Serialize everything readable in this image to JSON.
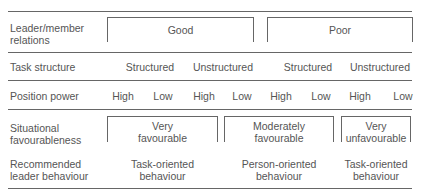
{
  "rows": {
    "relations": {
      "label_line1": "Leader/member",
      "label_line2": "relations",
      "groups": [
        "Good",
        "Poor"
      ]
    },
    "task_structure": {
      "label": "Task structure",
      "values": [
        "Structured",
        "Unstructured",
        "Structured",
        "Unstructured"
      ]
    },
    "position_power": {
      "label": "Position power",
      "values": [
        "High",
        "Low",
        "High",
        "Low",
        "High",
        "Low",
        "High",
        "Low"
      ]
    },
    "favourableness": {
      "label_line1": "Situational",
      "label_line2": "favourableness",
      "groups": [
        {
          "line1": "Very",
          "line2": "favourable"
        },
        {
          "line1": "Moderately",
          "line2": "favourable"
        },
        {
          "line1": "Very",
          "line2": "unfavourable"
        }
      ]
    },
    "behaviour": {
      "label_line1": "Recommended",
      "label_line2": "leader behaviour",
      "groups": [
        {
          "line1": "Task-oriented",
          "line2": "behaviour"
        },
        {
          "line1": "Person-oriented",
          "line2": "behaviour"
        },
        {
          "line1": "Task-oriented",
          "line2": "behaviour"
        }
      ]
    }
  }
}
